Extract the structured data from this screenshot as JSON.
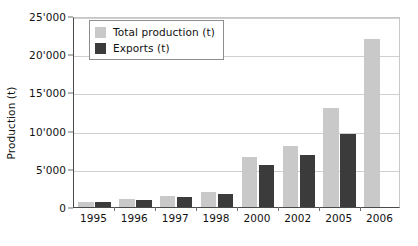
{
  "chart_data": {
    "type": "bar",
    "title": "",
    "xlabel": "",
    "ylabel": "Production (t)",
    "categories": [
      "1995",
      "1996",
      "1997",
      "1998",
      "2000",
      "2002",
      "2005",
      "2006"
    ],
    "series": [
      {
        "name": "Total production (t)",
        "color": "#c9c9c9",
        "values": [
          700,
          1000,
          1500,
          1900,
          6500,
          8000,
          13000,
          22000
        ]
      },
      {
        "name": "Exports (t)",
        "color": "#3b3b3b",
        "values": [
          600,
          900,
          1300,
          1700,
          5500,
          6800,
          9600,
          null
        ]
      }
    ],
    "ylim": [
      0,
      25000
    ],
    "ytick_values": [
      0,
      5000,
      10000,
      15000,
      20000,
      25000
    ],
    "ytick_labels": [
      "0",
      "5'000",
      "10'000",
      "15'000",
      "20'000",
      "25'000"
    ],
    "grid": true,
    "legend_position": "top-left"
  },
  "legend": {
    "entries": [
      {
        "label": "Total production (t)",
        "swatch": "total"
      },
      {
        "label": "Exports (t)",
        "swatch": "exports"
      }
    ]
  },
  "colors": {
    "total": "#c9c9c9",
    "exports": "#3b3b3b",
    "axis": "#4a4a4a",
    "grid": "#cfcfcf",
    "background": "#ffffff"
  }
}
